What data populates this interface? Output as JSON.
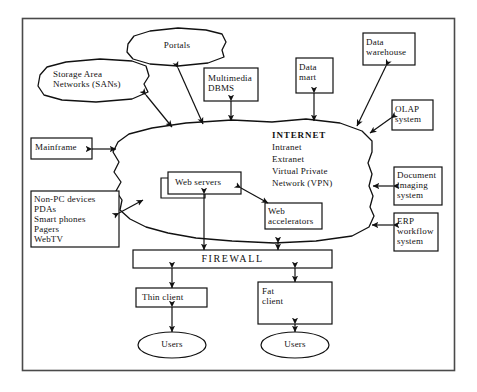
{
  "diagram": {
    "border_color": "#4a4a4a",
    "line_color": "#111111",
    "background": "#ffffff"
  },
  "clouds": [
    {
      "id": "portals",
      "label": "Portals"
    },
    {
      "id": "sans",
      "label": "Storage Area\nNetworks (SANs)"
    }
  ],
  "internet": {
    "line1": "INTERNET",
    "line2": "Intranet",
    "line3": "Extranet",
    "line4": "Virtual Private",
    "line5": "Network (VPN)"
  },
  "boxes": [
    {
      "id": "multimedia-dbms",
      "label": "Multimedia\nDBMS"
    },
    {
      "id": "data-mart",
      "label": "Data\nmart"
    },
    {
      "id": "data-warehouse",
      "label": "Data\nwarehouse"
    },
    {
      "id": "olap-system",
      "label": "OLAP\nsystem"
    },
    {
      "id": "document-imaging-system",
      "label": "Document\nimaging\nsystem"
    },
    {
      "id": "erp-workflow-system",
      "label": "ERP\nworkflow\nsystem"
    },
    {
      "id": "mainframe",
      "label": "Mainframe"
    },
    {
      "id": "non-pc-devices",
      "label": "Non-PC devices\nPDAs\nSmart phones\nPagers\nWebTV"
    },
    {
      "id": "web-servers",
      "label": "Web servers"
    },
    {
      "id": "web-accelerators",
      "label": "Web\naccelerators"
    },
    {
      "id": "firewall",
      "label": "FIREWALL"
    },
    {
      "id": "thin-client",
      "label": "Thin client"
    },
    {
      "id": "fat-client",
      "label": "Fat\nclient"
    }
  ],
  "ellipses": [
    {
      "id": "users-thin",
      "label": "Users"
    },
    {
      "id": "users-fat",
      "label": "Users"
    }
  ]
}
